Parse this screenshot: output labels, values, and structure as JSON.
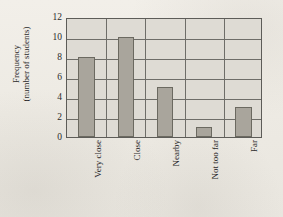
{
  "chart_data": {
    "type": "bar",
    "title": "",
    "xlabel": "",
    "ylabel": "Frequency (number of students)",
    "ylabel_line1": "Frequency",
    "ylabel_line2": "(number of students)",
    "categories": [
      "Very close",
      "Close",
      "Nearby",
      "Not too far",
      "Far"
    ],
    "values": [
      8,
      10,
      5,
      1,
      3
    ],
    "ylim": [
      0,
      12
    ],
    "ytick_labels": [
      "0",
      "2",
      "4",
      "6",
      "8",
      "10",
      "12"
    ],
    "ytick_values": [
      0,
      2,
      4,
      6,
      8,
      10,
      12
    ],
    "grid": true,
    "legend": "none",
    "colors": {
      "bar_fill": "#a9a59c",
      "bar_border": "#6b6960",
      "plot_background": "#dedbd4",
      "axis": "#5d5c58",
      "gridline": "#6e6d68",
      "page_background": "#efece6",
      "text": "#2b2b2b"
    }
  }
}
